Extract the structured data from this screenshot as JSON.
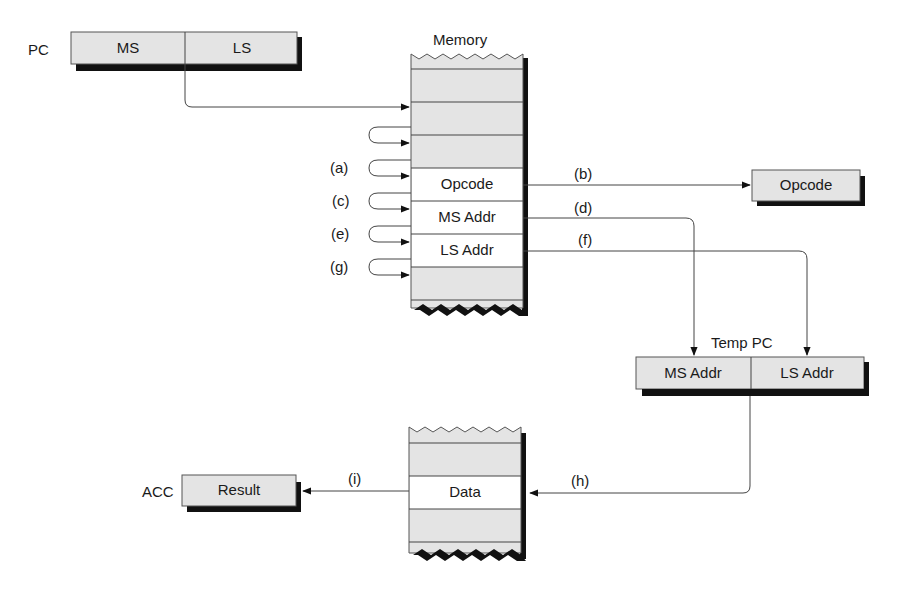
{
  "pc_register": {
    "label": "PC",
    "fields": [
      "MS",
      "LS"
    ]
  },
  "memory": {
    "title": "Memory",
    "rows": [
      "",
      "",
      "",
      "",
      "Opcode",
      "MS Addr",
      "LS Addr",
      "",
      ""
    ]
  },
  "loop_labels": [
    "(a)",
    "(c)",
    "(e)",
    "(g)"
  ],
  "opcode_register": {
    "label": "Opcode"
  },
  "arrow_labels": {
    "b": "(b)",
    "d": "(d)",
    "f": "(f)",
    "h": "(h)",
    "i": "(i)"
  },
  "temp_pc": {
    "label": "Temp PC",
    "fields": [
      "MS Addr",
      "LS Addr"
    ]
  },
  "data_memory": {
    "rows": [
      "",
      "",
      "Data",
      "",
      ""
    ]
  },
  "acc_register": {
    "label": "ACC",
    "field": "Result"
  },
  "colors": {
    "register_fill": "#e4e4e4",
    "shadow": "#111111",
    "line": "#444444"
  }
}
